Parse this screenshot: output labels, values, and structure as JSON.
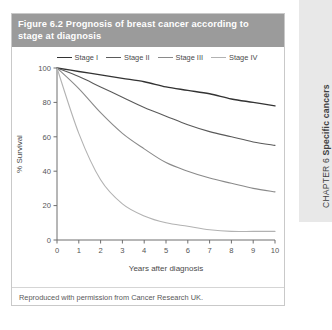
{
  "figure": {
    "title_number": "Figure 6.2",
    "title_text": "Prognosis of breast cancer according to stage at diagnosis",
    "source_note": "Reproduced with permission from Cancer Research UK."
  },
  "sidebar": {
    "chapter_prefix": "CHAPTER 6 ",
    "chapter_title": "Specific cancers"
  },
  "colors": {
    "title_bar": "#9b9b9b",
    "title_text": "#ffffff",
    "frame_border": "#c9c9c9",
    "axis": "#6f6f6f",
    "stage_1": "#333333",
    "stage_2": "#5a5a5a",
    "stage_3": "#8a8a8a",
    "stage_4": "#b2b2b2",
    "tab_bg": "#e8e8e8"
  },
  "chart_data": {
    "type": "line",
    "title": "Figure 6.2  Prognosis of breast cancer according to stage at diagnosis",
    "xlabel": "Years after diagnosis",
    "ylabel": "% Survival",
    "xlim": [
      0,
      10
    ],
    "ylim": [
      0,
      100
    ],
    "xticks": [
      0,
      1,
      2,
      3,
      4,
      5,
      6,
      7,
      8,
      9,
      10
    ],
    "yticks": [
      0,
      20,
      40,
      60,
      80,
      100
    ],
    "xtick_labels": [
      "0",
      "1",
      "2",
      "3",
      "4",
      "5",
      "6",
      "7",
      "8",
      "9",
      "10"
    ],
    "ytick_labels": [
      "0",
      "20",
      "40",
      "60",
      "80",
      "100"
    ],
    "grid": false,
    "legend_position": "top-center",
    "x": [
      0,
      1,
      2,
      3,
      4,
      5,
      6,
      7,
      8,
      9,
      10
    ],
    "series": [
      {
        "name": "Stage I",
        "color": "#333333",
        "values": [
          100,
          98,
          96,
          94,
          92,
          89,
          87,
          85,
          82,
          80,
          78
        ]
      },
      {
        "name": "Stage II",
        "color": "#5a5a5a",
        "values": [
          100,
          95,
          89,
          83,
          77,
          72,
          67,
          63,
          60,
          57,
          55
        ]
      },
      {
        "name": "Stage III",
        "color": "#8a8a8a",
        "values": [
          100,
          88,
          74,
          62,
          53,
          45,
          40,
          36,
          33,
          30,
          28
        ]
      },
      {
        "name": "Stage IV",
        "color": "#b2b2b2",
        "values": [
          100,
          62,
          35,
          21,
          14,
          10,
          8,
          6,
          5,
          5,
          5
        ]
      }
    ]
  }
}
